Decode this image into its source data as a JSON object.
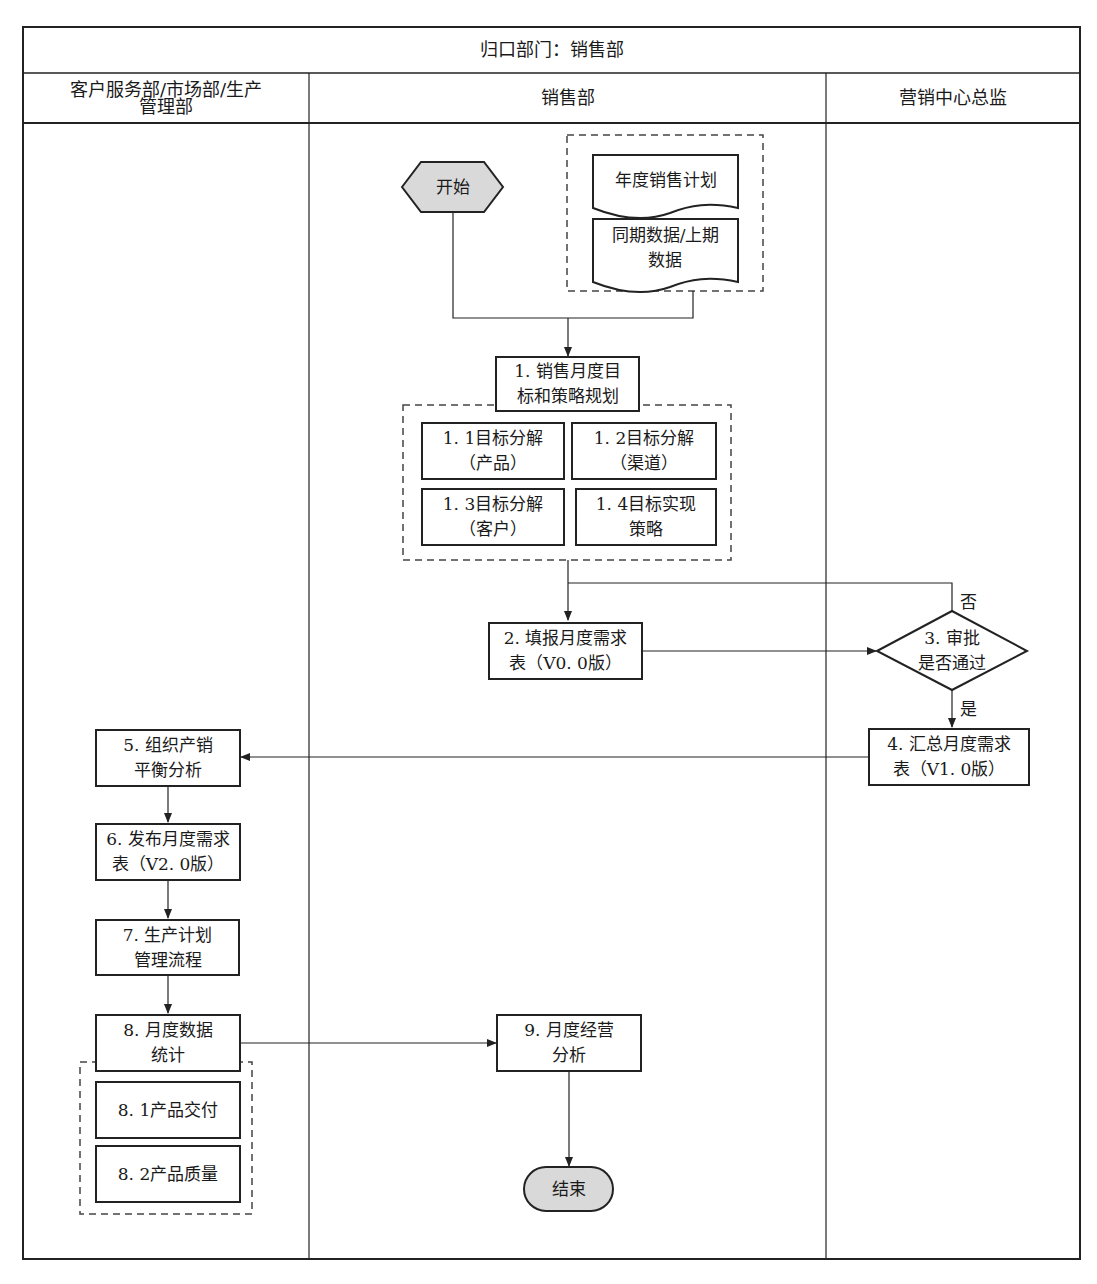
{
  "header": {
    "title": "归口部门：销售部"
  },
  "lanes": [
    {
      "id": "lane-1",
      "label": "客户服务部/市场部/生产\n管理部"
    },
    {
      "id": "lane-2",
      "label": "销售部"
    },
    {
      "id": "lane-3",
      "label": "营销中心总监"
    }
  ],
  "nodes": {
    "start": {
      "label": "开始",
      "shape": "hexagon",
      "fill": "#d9d9d9"
    },
    "doc_annual_plan": {
      "label": "年度销售计划",
      "shape": "document"
    },
    "doc_history_data": {
      "label": "同期数据/上期\n数据",
      "shape": "document"
    },
    "step1": {
      "label": "1. 销售月度目\n标和策略规划",
      "shape": "rect"
    },
    "step1_1": {
      "label": "1. 1目标分解\n（产品）",
      "shape": "rect"
    },
    "step1_2": {
      "label": "1. 2目标分解\n（渠道）",
      "shape": "rect"
    },
    "step1_3": {
      "label": "1. 3目标分解\n（客户）",
      "shape": "rect"
    },
    "step1_4": {
      "label": "1. 4目标实现\n策略",
      "shape": "rect"
    },
    "step2": {
      "label": "2. 填报月度需求\n表（V0. 0版）",
      "shape": "rect"
    },
    "step3": {
      "label": "3. 审批\n是否通过",
      "shape": "diamond"
    },
    "step4": {
      "label": "4. 汇总月度需求\n表（V1. 0版）",
      "shape": "rect"
    },
    "step5": {
      "label": "5. 组织产销\n平衡分析",
      "shape": "rect"
    },
    "step6": {
      "label": "6. 发布月度需求\n表（V2. 0版）",
      "shape": "rect"
    },
    "step7": {
      "label": "7. 生产计划\n管理流程",
      "shape": "predefined-process"
    },
    "step8": {
      "label": "8. 月度数据\n统计",
      "shape": "rect"
    },
    "step8_1": {
      "label": "8. 1产品交付",
      "shape": "rect"
    },
    "step8_2": {
      "label": "8. 2产品质量",
      "shape": "rect"
    },
    "step9": {
      "label": "9. 月度经营\n分析",
      "shape": "rect"
    },
    "end": {
      "label": "结束",
      "shape": "terminator",
      "fill": "#d9d9d9"
    }
  },
  "edge_labels": {
    "no": "否",
    "yes": "是"
  },
  "colors": {
    "line": "#222222",
    "terminal_fill": "#d9d9d9",
    "background": "#ffffff"
  }
}
